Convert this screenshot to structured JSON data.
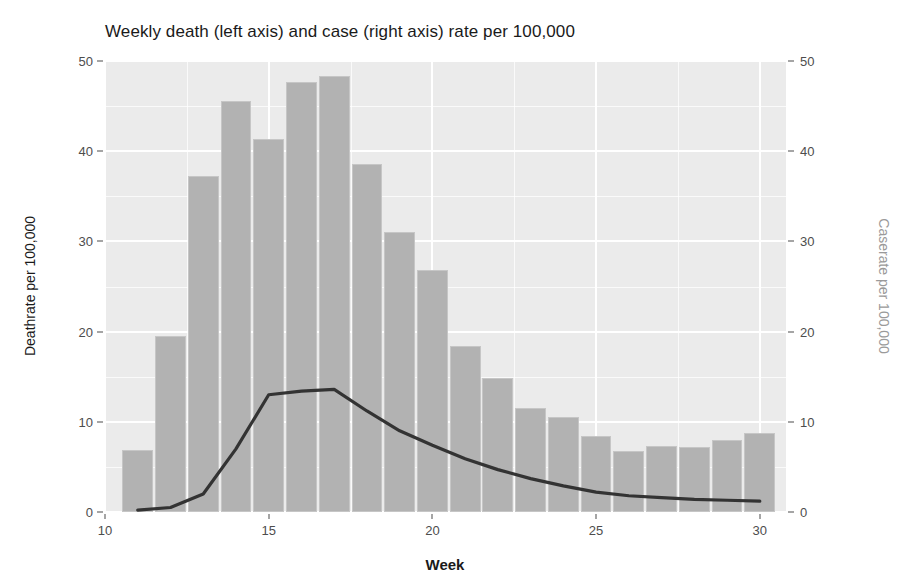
{
  "chart_data": {
    "type": "bar",
    "title": "Weekly death (left axis) and case (right axis) rate per 100,000",
    "xlabel": "Week",
    "ylabel": "Deathrate per 100,000",
    "y2label": "Caserate per 100,000",
    "xlim": [
      10.0,
      30.8
    ],
    "ylim": [
      0,
      50
    ],
    "y2lim": [
      0,
      50
    ],
    "xticks": [
      10,
      15,
      20,
      25,
      30
    ],
    "yticks": [
      0,
      10,
      20,
      30,
      40,
      50
    ],
    "y2ticks": [
      0,
      10,
      20,
      30,
      40,
      50
    ],
    "grid": true,
    "legend": "none",
    "x": [
      11,
      12,
      13,
      14,
      15,
      16,
      17,
      18,
      19,
      20,
      21,
      22,
      23,
      24,
      25,
      26,
      27,
      28,
      29,
      30
    ],
    "series": [
      {
        "name": "Deathrate per 100,000",
        "type": "bar",
        "axis": "left",
        "color": "#b2b2b2",
        "border_color": "#c6c6c6",
        "values": [
          6.9,
          19.5,
          37.2,
          45.6,
          41.3,
          47.7,
          48.3,
          38.6,
          31.0,
          26.8,
          18.4,
          14.9,
          11.5,
          10.5,
          8.4,
          6.8,
          7.3,
          7.2,
          8.0,
          8.8
        ]
      },
      {
        "name": "Caserate per 100,000",
        "type": "line",
        "axis": "right",
        "color": "#333333",
        "values": [
          0.2,
          0.5,
          2.0,
          7.0,
          13.0,
          13.4,
          13.6,
          11.2,
          9.0,
          7.4,
          5.9,
          4.7,
          3.7,
          2.9,
          2.2,
          1.8,
          1.6,
          1.4,
          1.3,
          1.2
        ]
      }
    ]
  },
  "style": {
    "panel_background": "#ebebeb",
    "grid_color": "#ffffff",
    "axis_text_color": "#4d4d4d",
    "title_color": "#1a1a1a",
    "right_axis_title_color": "#9a9a9a"
  }
}
